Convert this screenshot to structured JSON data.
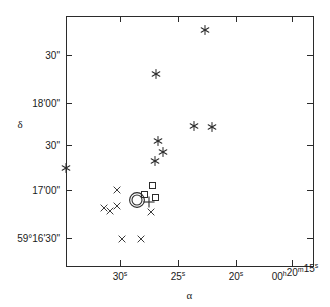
{
  "figure": {
    "title": "",
    "background_color": "#ffffff",
    "ink_color": "#2b2b2b"
  },
  "axes": {
    "x_label": "α",
    "y_label": "δ",
    "x_ticks": [
      {
        "base": "30",
        "sup": "s",
        "px": 120
      },
      {
        "base": "25",
        "sup": "s",
        "px": 178
      },
      {
        "base": "20",
        "sup": "s",
        "px": 236
      },
      {
        "base": "00",
        "sup": "h",
        "base2": "20",
        "sup2": "m",
        "base3": "15",
        "sup3": "s",
        "px": 292
      }
    ],
    "y_ticks": [
      {
        "label": "30\"",
        "px": 55
      },
      {
        "label": "18'00\"",
        "px": 103
      },
      {
        "label": "30\"",
        "px": 145
      },
      {
        "label": "17'00\"",
        "px": 190
      },
      {
        "label": "59°16'30\"",
        "px": 238
      }
    ],
    "plot_box": {
      "left": 66,
      "right": 313,
      "top": 16,
      "bottom": 266
    }
  },
  "chart_data": {
    "type": "scatter",
    "title": "",
    "xlabel": "α",
    "ylabel": "δ",
    "grid": false,
    "legend": "none",
    "x_axis_note": "Right ascension, seconds of time, increasing to the left (00h20m)",
    "y_axis_note": "Declination, +59°16'30\" to +59°18'30\"",
    "xlim_px": [
      66,
      313
    ],
    "ylim_px": [
      16,
      266
    ],
    "series": [
      {
        "name": "asterisk-sources",
        "marker": "asterisk",
        "points": [
          {
            "px": 205,
            "py": 30
          },
          {
            "px": 156,
            "py": 74
          },
          {
            "px": 66,
            "py": 168
          },
          {
            "px": 194,
            "py": 126
          },
          {
            "px": 212,
            "py": 127
          },
          {
            "px": 158,
            "py": 141
          },
          {
            "px": 163,
            "py": 152
          },
          {
            "px": 155,
            "py": 161
          }
        ]
      },
      {
        "name": "cross-sources",
        "marker": "x",
        "points": [
          {
            "px": 117,
            "py": 190
          },
          {
            "px": 104,
            "py": 208
          },
          {
            "px": 110,
            "py": 211
          },
          {
            "px": 117,
            "py": 206
          },
          {
            "px": 151,
            "py": 212
          },
          {
            "px": 122,
            "py": 239
          },
          {
            "px": 141,
            "py": 239
          }
        ]
      },
      {
        "name": "square-sources",
        "marker": "square",
        "points": [
          {
            "px": 152,
            "py": 185
          },
          {
            "px": 144,
            "py": 194
          },
          {
            "px": 155,
            "py": 197
          }
        ]
      },
      {
        "name": "double-circle-source",
        "marker": "double-circle",
        "points": [
          {
            "px": 137,
            "py": 200
          }
        ]
      },
      {
        "name": "plus-source",
        "marker": "plus",
        "points": [
          {
            "px": 149,
            "py": 202
          }
        ]
      }
    ]
  }
}
